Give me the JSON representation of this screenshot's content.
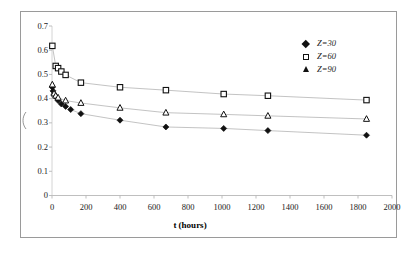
{
  "chart_data": {
    "type": "scatter",
    "title": "",
    "xlabel": "t (hours)",
    "ylabel": "",
    "xlim": [
      0,
      2000
    ],
    "ylim": [
      0,
      0.7
    ],
    "xticks": [
      0,
      200,
      400,
      600,
      800,
      1000,
      1200,
      1400,
      1600,
      1800,
      2000
    ],
    "xtick_labels": [
      "0",
      "200",
      "400",
      "600",
      "800",
      "1000",
      "1200",
      "1400",
      "1600",
      "1800",
      "2000"
    ],
    "yticks": [
      0,
      0.1,
      0.2,
      0.3,
      0.4,
      0.5,
      0.6,
      0.7
    ],
    "ytick_labels": [
      "0",
      "0.1",
      "0.2",
      "0.3",
      "0.4",
      "0.5",
      "0.6",
      "0.7"
    ],
    "grid": false,
    "legend_position": "top-right",
    "marker_color": "#111111",
    "line_color": "#b4b4b4",
    "series": [
      {
        "name": "Z=30",
        "marker": "filled-diamond",
        "x": [
          2,
          6,
          12,
          22,
          36,
          55,
          80,
          110,
          170,
          400,
          670,
          1010,
          1270,
          1850
        ],
        "y": [
          0.447,
          0.432,
          0.418,
          0.407,
          0.392,
          0.378,
          0.368,
          0.355,
          0.338,
          0.311,
          0.283,
          0.277,
          0.268,
          0.249
        ]
      },
      {
        "name": "Z=60",
        "marker": "open-square",
        "x": [
          2,
          22,
          36,
          55,
          80,
          170,
          400,
          670,
          1010,
          1270,
          1850
        ],
        "y": [
          0.618,
          0.535,
          0.526,
          0.512,
          0.498,
          0.466,
          0.447,
          0.435,
          0.419,
          0.412,
          0.394
        ]
      },
      {
        "name": "Z=90",
        "marker": "open-triangle",
        "x": [
          2,
          12,
          22,
          36,
          80,
          170,
          400,
          670,
          1010,
          1270,
          1850
        ],
        "y": [
          0.458,
          0.421,
          0.412,
          0.404,
          0.392,
          0.382,
          0.362,
          0.342,
          0.335,
          0.329,
          0.316
        ]
      }
    ]
  },
  "legend": {
    "items": [
      {
        "label": "Z=30",
        "marker": "filled-diamond"
      },
      {
        "label": "Z=60",
        "marker": "open-square"
      },
      {
        "label": "Z=90",
        "marker": "open-triangle"
      }
    ]
  },
  "axes": {
    "xaxis_title": "t (hours)"
  }
}
